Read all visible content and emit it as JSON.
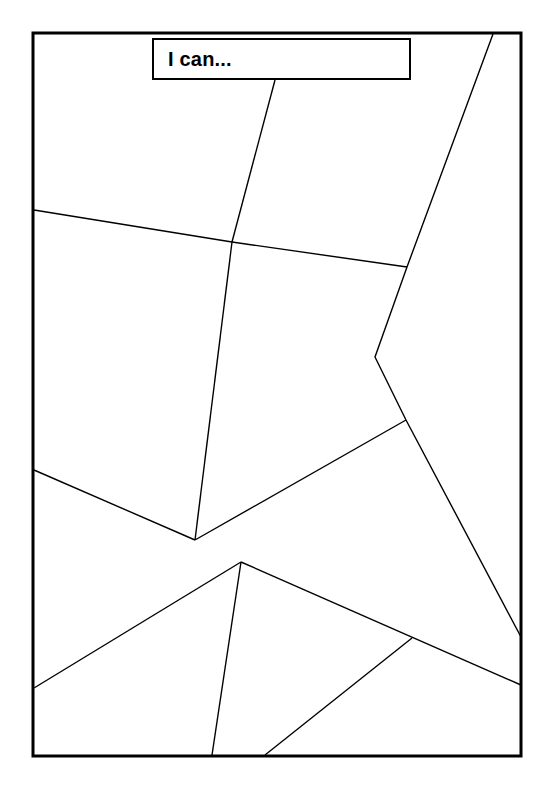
{
  "page": {
    "name": "i-can-graphic-organizer",
    "width": 556,
    "height": 797,
    "background_color": "#ffffff",
    "ink_color": "#000000"
  },
  "title_box": {
    "label": "I can...",
    "x": 152,
    "y": 38,
    "width": 259,
    "height": 42,
    "border_width": 2,
    "border_color": "#000000",
    "fill_color": "#ffffff",
    "text_color": "#000000",
    "font_size_px": 20,
    "font_weight": "bold"
  },
  "frame": {
    "name": "outer-border",
    "x": 33,
    "y": 33,
    "width": 488,
    "height": 723,
    "stroke_width": 3,
    "stroke_color": "#000000",
    "fill_color": "#ffffff"
  },
  "divider_lines": [
    {
      "name": "divider-top-left-diagonal",
      "points": [
        [
          275,
          80
        ],
        [
          232,
          242
        ]
      ],
      "stroke_width": 1.4
    },
    {
      "name": "divider-upper-horizontal",
      "points": [
        [
          34,
          210
        ],
        [
          232,
          242
        ],
        [
          407,
          267
        ]
      ],
      "stroke_width": 1.4
    },
    {
      "name": "divider-top-right-long-diagonal",
      "points": [
        [
          493,
          34
        ],
        [
          407,
          267
        ],
        [
          375,
          357
        ],
        [
          406,
          420
        ],
        [
          521,
          637
        ]
      ],
      "stroke_width": 1.4
    },
    {
      "name": "divider-center-vertical",
      "points": [
        [
          232,
          242
        ],
        [
          195,
          540
        ]
      ],
      "stroke_width": 1.4
    },
    {
      "name": "divider-left-midline",
      "points": [
        [
          34,
          470
        ],
        [
          195,
          540
        ]
      ],
      "stroke_width": 1.4
    },
    {
      "name": "divider-center-to-right-bend",
      "points": [
        [
          195,
          540
        ],
        [
          406,
          420
        ]
      ],
      "stroke_width": 1.4
    },
    {
      "name": "divider-center-to-lower-left",
      "points": [
        [
          241,
          562
        ],
        [
          34,
          688
        ]
      ],
      "stroke_width": 1.4
    },
    {
      "name": "divider-center-to-right-edge",
      "points": [
        [
          241,
          562
        ],
        [
          521,
          685
        ]
      ],
      "stroke_width": 1.4
    },
    {
      "name": "divider-center-to-bottom-vertical",
      "points": [
        [
          241,
          562
        ],
        [
          212,
          755
        ]
      ],
      "stroke_width": 1.4
    },
    {
      "name": "divider-bottom-right-diagonal",
      "points": [
        [
          265,
          755
        ],
        [
          412,
          638
        ]
      ],
      "stroke_width": 1.4
    }
  ],
  "junction_points": [
    {
      "name": "junction-upper-center",
      "x": 232,
      "y": 242
    },
    {
      "name": "junction-upper-right",
      "x": 407,
      "y": 267
    },
    {
      "name": "junction-right-bend",
      "x": 375,
      "y": 357
    },
    {
      "name": "junction-right-mid",
      "x": 406,
      "y": 420
    },
    {
      "name": "junction-center-left",
      "x": 195,
      "y": 540
    },
    {
      "name": "junction-center-lower",
      "x": 241,
      "y": 562
    },
    {
      "name": "junction-lower-right",
      "x": 412,
      "y": 638
    }
  ]
}
